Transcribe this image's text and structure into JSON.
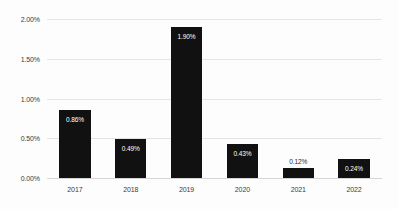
{
  "chart_data": {
    "type": "bar",
    "title": "",
    "subtitle": "",
    "xlabel": "",
    "ylabel": "",
    "categories": [
      "2017",
      "2018",
      "2019",
      "2020",
      "2021",
      "2022"
    ],
    "values": [
      0.86,
      0.49,
      1.9,
      0.43,
      0.12,
      0.24
    ],
    "data_labels": [
      "0.86%",
      "0.49%",
      "1.90%",
      "0.43%",
      "0.12%",
      "0.24%"
    ],
    "label_placement": [
      "inside",
      "inside",
      "inside",
      "inside",
      "outside",
      "inside"
    ],
    "ylim": [
      0,
      2.0
    ],
    "y_ticks": [
      0,
      0.5,
      1.0,
      1.5,
      2.0
    ],
    "y_tick_labels": [
      "0.00%",
      "0.50%",
      "1.00%",
      "1.50%",
      "2.00%"
    ],
    "grid": "horizontal",
    "legend": "none",
    "bar_color": "#111111",
    "gridline_color": "#e4e4e4",
    "background_color": "#fdfdfd",
    "inside_label_color": "#ffffff",
    "outside_label_color": "#2b2b2b"
  }
}
